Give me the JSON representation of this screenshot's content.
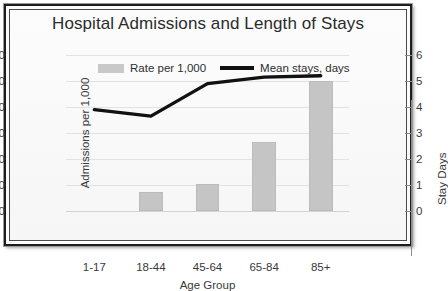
{
  "chart_data": {
    "type": "bar",
    "title": "Hospital Admissions and Length of Stays",
    "xlabel": "Age Group",
    "ylabel": "Admissions per 1,000",
    "y2label": "Stay Days",
    "categories": [
      "1-17",
      "18-44",
      "45-64",
      "65-84",
      "85+"
    ],
    "yticks": [
      0,
      100,
      200,
      300,
      400,
      500,
      600
    ],
    "y2ticks": [
      0,
      1,
      2,
      3,
      4,
      5,
      6
    ],
    "ylim": [
      0,
      600
    ],
    "y2lim": [
      0,
      6
    ],
    "grid": true,
    "legend_position": "top-center-inside",
    "series": [
      {
        "name": "Rate per 1,000",
        "type": "bar",
        "axis": "left",
        "color": "#c5c5c5",
        "values": [
          0,
          75,
          105,
          265,
          500
        ]
      },
      {
        "name": "Mean stays, days",
        "type": "line",
        "axis": "right",
        "color": "#111111",
        "values": [
          3.9,
          3.65,
          4.9,
          5.15,
          5.2
        ]
      }
    ]
  },
  "legend": {
    "bar_label": "Rate per 1,000",
    "line_label": "Mean stays, days"
  }
}
